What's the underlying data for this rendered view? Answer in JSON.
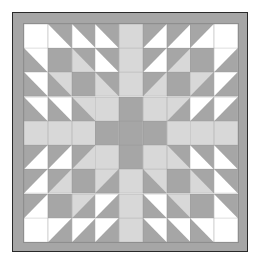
{
  "artwork": {
    "title": "Quilt Block Pattern",
    "description": "Nine-by-nine symmetric pieced quilt block with half-square triangles forming a feathered star / bear's paw motif, enclosed by a solid gray border band.",
    "type": "quilt-block",
    "grid": {
      "rows": 9,
      "columns": 9
    },
    "palette": {
      "white": "#ffffff",
      "light": "#d8d8d8",
      "medium": "#a6a6a6",
      "dark_outline": "#3a3a3a",
      "seam": "#8e8e8e",
      "background": "#ffffff",
      "border_band": "#a6a6a6"
    },
    "legend": [
      {
        "key": "W",
        "label": "White patch",
        "color": "#ffffff"
      },
      {
        "key": "L",
        "label": "Light gray patch",
        "color": "#d8d8d8"
      },
      {
        "key": "M",
        "label": "Medium gray patch",
        "color": "#a6a6a6"
      }
    ],
    "cell_codes": {
      "W": "solid white",
      "L": "solid light gray",
      "M": "solid medium gray",
      "tl": "half-square triangle, medium gray in top-left corner",
      "tr": "half-square triangle, medium gray in top-right corner",
      "bl": "half-square triangle, medium gray in bottom-left corner",
      "br": "half-square triangle, medium gray in bottom-right corner",
      "tlL": "half-square triangle, medium gray top-left over light gray",
      "trL": "half-square triangle, medium gray top-right over light gray",
      "blL": "half-square triangle, medium gray bottom-left over light gray",
      "brL": "half-square triangle, medium gray bottom-right over light gray"
    },
    "cells": [
      [
        "W",
        "tr",
        "tr",
        "tr",
        "L",
        "tl",
        "tl",
        "tl",
        "W"
      ],
      [
        "bl",
        "M",
        "trL",
        "tr",
        "L",
        "tl",
        "tlL",
        "M",
        "br"
      ],
      [
        "bl",
        "blL",
        "M",
        "trL",
        "L",
        "tlL",
        "M",
        "brL",
        "br"
      ],
      [
        "bl",
        "bl",
        "blL",
        "L",
        "M",
        "L",
        "brL",
        "br",
        "br"
      ],
      [
        "L",
        "L",
        "L",
        "M",
        "M",
        "M",
        "L",
        "L",
        "L"
      ],
      [
        "tl",
        "tl",
        "tlL",
        "L",
        "M",
        "L",
        "trL",
        "tr",
        "tr"
      ],
      [
        "tl",
        "tlL",
        "M",
        "brL",
        "L",
        "blL",
        "M",
        "trL",
        "tr"
      ],
      [
        "tl",
        "M",
        "brL",
        "br",
        "L",
        "bl",
        "blL",
        "M",
        "tr"
      ],
      [
        "W",
        "br",
        "br",
        "br",
        "L",
        "bl",
        "bl",
        "bl",
        "W"
      ]
    ]
  }
}
